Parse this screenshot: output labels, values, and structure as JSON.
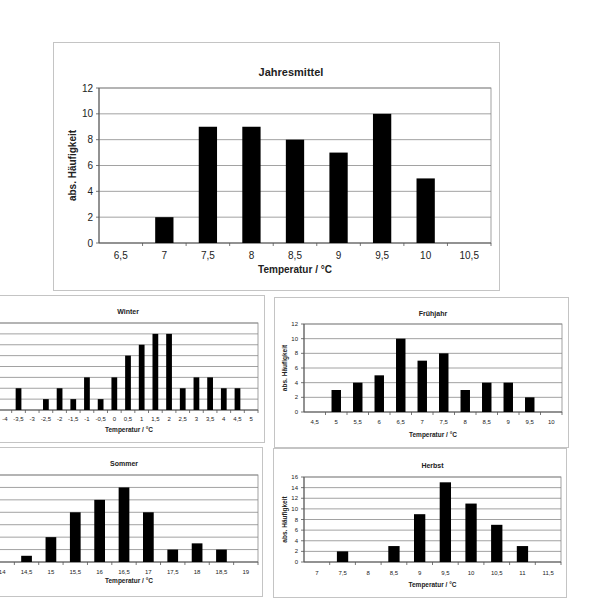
{
  "chart_data": [
    {
      "id": "jahresmittel",
      "type": "bar",
      "title": "Jahresmittel",
      "xlabel": "Temperatur / °C",
      "ylabel": "abs. Häufigkeit",
      "categories": [
        "6,5",
        "7",
        "7,5",
        "8",
        "8,5",
        "9",
        "9,5",
        "10",
        "10,5"
      ],
      "values": [
        0,
        2,
        9,
        9,
        8,
        7,
        10,
        5,
        0
      ],
      "ylim": [
        0,
        12
      ],
      "ytick_step": 2,
      "yticks": [
        "0",
        "2",
        "4",
        "6",
        "8",
        "10",
        "12"
      ],
      "grid": true,
      "legend": null,
      "bar_color": "#000000"
    },
    {
      "id": "winter",
      "type": "bar",
      "title": "Winter",
      "xlabel": "Temperatur / °C",
      "ylabel": "",
      "categories": [
        "-4",
        "-3,5",
        "-3",
        "-2,5",
        "-2",
        "-1,5",
        "-1",
        "-0,5",
        "0",
        "0,5",
        "1",
        "1,5",
        "2",
        "2,5",
        "3",
        "3,5",
        "4",
        "4,5",
        "5"
      ],
      "values": [
        0,
        2,
        0,
        1,
        2,
        1,
        3,
        1,
        3,
        5,
        6,
        7,
        7,
        2,
        3,
        3,
        2,
        2,
        0
      ],
      "ylim": [
        0,
        8
      ],
      "ytick_step": 1,
      "yticks": [],
      "grid": true,
      "legend": null,
      "bar_color": "#000000"
    },
    {
      "id": "fruehjahr",
      "type": "bar",
      "title": "Frühjahr",
      "xlabel": "Temperatur / °C",
      "ylabel": "abs. Häufigkeit",
      "categories": [
        "4,5",
        "5",
        "5,5",
        "6",
        "6,5",
        "7",
        "7,5",
        "8",
        "8,5",
        "9",
        "9,5",
        "10"
      ],
      "values": [
        0,
        3,
        4,
        5,
        10,
        7,
        8,
        3,
        4,
        4,
        2,
        0
      ],
      "ylim": [
        0,
        12
      ],
      "ytick_step": 2,
      "yticks": [
        "0",
        "2",
        "4",
        "6",
        "8",
        "10",
        "12"
      ],
      "grid": true,
      "legend": null,
      "bar_color": "#000000"
    },
    {
      "id": "sommer",
      "type": "bar",
      "title": "Sommer",
      "xlabel": "Temperatur / °C",
      "ylabel": "",
      "categories": [
        "14",
        "14,5",
        "15",
        "15,5",
        "16",
        "16,5",
        "17",
        "17,5",
        "18",
        "18,5",
        "19"
      ],
      "values": [
        0,
        1,
        4,
        8,
        10,
        12,
        8,
        2,
        3,
        2,
        0
      ],
      "ylim": [
        0,
        14
      ],
      "ytick_step": 2,
      "yticks": [],
      "grid": true,
      "legend": null,
      "bar_color": "#000000"
    },
    {
      "id": "herbst",
      "type": "bar",
      "title": "Herbst",
      "xlabel": "Temperatur / °C",
      "ylabel": "abs. Häufigkeit",
      "categories": [
        "7",
        "7,5",
        "8",
        "8,5",
        "9",
        "9,5",
        "10",
        "10,5",
        "11",
        "11,5"
      ],
      "values": [
        0,
        2,
        0,
        3,
        9,
        15,
        11,
        7,
        3,
        0
      ],
      "ylim": [
        0,
        16
      ],
      "ytick_step": 2,
      "yticks": [
        "0",
        "2",
        "4",
        "6",
        "8",
        "10",
        "12",
        "14",
        "16"
      ],
      "grid": true,
      "legend": null,
      "bar_color": "#000000"
    }
  ]
}
